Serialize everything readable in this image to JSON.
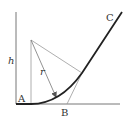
{
  "diagram": {
    "type": "geometry",
    "labels": {
      "h": "h",
      "A": "A",
      "B": "B",
      "C": "C",
      "r": "r"
    },
    "colors": {
      "curve": "#222222",
      "construction": "#999999",
      "axis": "#777777",
      "text": "#333333"
    },
    "points": {
      "origin": [
        16,
        104
      ],
      "center": [
        31,
        40
      ],
      "curve_start": [
        31,
        104
      ],
      "tangent_point": [
        82,
        73
      ],
      "B": [
        67,
        104
      ],
      "C_end": [
        122,
        12
      ]
    }
  }
}
